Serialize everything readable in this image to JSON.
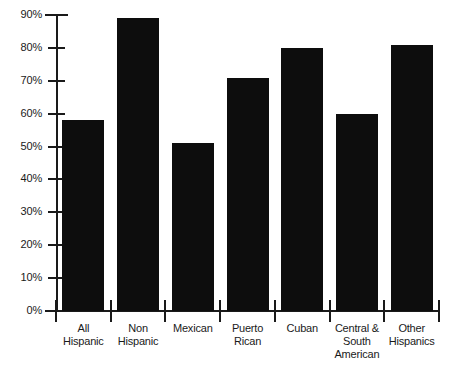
{
  "chart_data": {
    "type": "bar",
    "title": "",
    "subtitle": "",
    "xlabel": "",
    "ylabel": "",
    "ylim": [
      0,
      90
    ],
    "grid": false,
    "legend": false,
    "orientation": "vertical",
    "bar_color": "#0d0d0d",
    "categories": [
      "All Hispanic",
      "Non Hispanic",
      "Mexican",
      "Puerto Rican",
      "Cuban",
      "Central & South American",
      "Other Hispanics"
    ],
    "category_lines": [
      [
        "All",
        "Hispanic"
      ],
      [
        "Non",
        "Hispanic"
      ],
      [
        "Mexican"
      ],
      [
        "Puerto",
        "Rican"
      ],
      [
        "Cuban"
      ],
      [
        "Central &",
        "South",
        "American"
      ],
      [
        "Other",
        "Hispanics"
      ]
    ],
    "values": [
      58,
      89,
      51,
      71,
      80,
      60,
      81
    ],
    "value_labels": [
      "58%",
      "89%",
      "51%",
      "71%",
      "80%",
      "60%",
      "81%"
    ],
    "yticks": [
      0,
      10,
      20,
      30,
      40,
      50,
      60,
      70,
      80,
      90
    ],
    "ytick_labels": [
      "0%",
      "10%",
      "20%",
      "30%",
      "40%",
      "50%",
      "60%",
      "70%",
      "80%",
      "90%"
    ]
  },
  "axis": {
    "y_axis_name": "percent-axis",
    "x_axis_name": "category-axis"
  }
}
